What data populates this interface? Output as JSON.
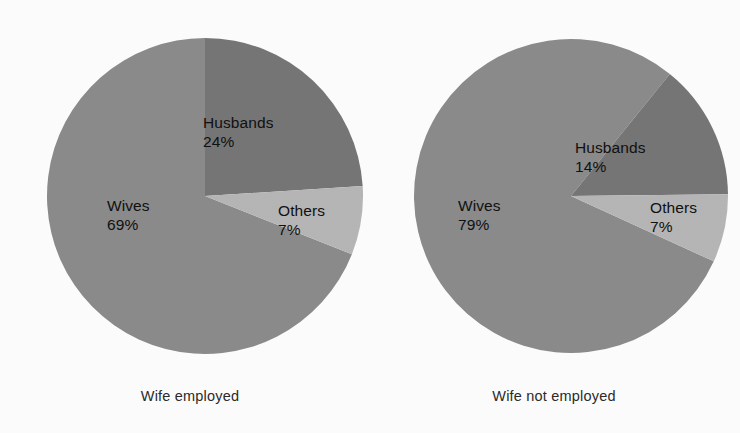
{
  "chart_data": [
    {
      "type": "pie",
      "title": "Wife employed",
      "categories": [
        "Husbands",
        "Others",
        "Wives"
      ],
      "values": [
        24,
        7,
        69
      ],
      "labels": [
        "24%",
        "7%",
        "69%"
      ],
      "unit": "%",
      "legend": "none",
      "slice_colors": [
        "#767676",
        "#b6b6b6",
        "#8b8b8b"
      ],
      "start_angle_deg": 0,
      "direction": "clockwise",
      "geometry": {
        "cx": 205,
        "cy": 196,
        "r": 158
      }
    },
    {
      "type": "pie",
      "title": "Wife not employed",
      "categories": [
        "Husbands",
        "Others",
        "Wives"
      ],
      "values": [
        14,
        7,
        79
      ],
      "labels": [
        "14%",
        "7%",
        "79%"
      ],
      "unit": "%",
      "legend": "none",
      "slice_colors": [
        "#767676",
        "#b6b6b6",
        "#8b8b8b"
      ],
      "start_angle_deg": 39,
      "direction": "clockwise",
      "geometry": {
        "cx": 203,
        "cy": 196,
        "r": 157
      }
    }
  ],
  "charts": {
    "left": {
      "caption": "Wife employed",
      "slices": {
        "husbands": {
          "name": "Husbands",
          "value": "24%"
        },
        "others": {
          "name": "Others",
          "value": "7%"
        },
        "wives": {
          "name": "Wives",
          "value": "69%"
        }
      }
    },
    "right": {
      "caption": "Wife not employed",
      "slices": {
        "husbands": {
          "name": "Husbands",
          "value": "14%"
        },
        "others": {
          "name": "Others",
          "value": "7%"
        },
        "wives": {
          "name": "Wives",
          "value": "79%"
        }
      }
    }
  },
  "colors": {
    "wives": "#8b8b8b",
    "husbands": "#767676",
    "others": "#b6b6b6",
    "background": "#fdfdfd",
    "text": "#111111"
  }
}
